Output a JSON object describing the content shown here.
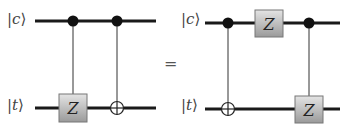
{
  "diagram": {
    "type": "quantum-circuit-identity",
    "left_circuit": {
      "qubits": [
        {
          "name": "control",
          "label_symbol": "c",
          "label": "|c⟩"
        },
        {
          "name": "target",
          "label_symbol": "t",
          "label": "|t⟩"
        }
      ],
      "gates": [
        {
          "type": "controlled-Z",
          "control": "c",
          "target": "t",
          "label": "Z"
        },
        {
          "type": "CNOT",
          "control": "c",
          "target": "t"
        }
      ]
    },
    "equals": "=",
    "right_circuit": {
      "qubits": [
        {
          "name": "control",
          "label_symbol": "c",
          "label": "|c⟩"
        },
        {
          "name": "target",
          "label_symbol": "t",
          "label": "|t⟩"
        }
      ],
      "gates": [
        {
          "type": "CNOT",
          "control": "c",
          "target": "t"
        },
        {
          "type": "Z",
          "qubit": "c",
          "label": "Z"
        },
        {
          "type": "controlled-Z",
          "control": "c",
          "target": "t",
          "label": "Z"
        }
      ]
    },
    "colors": {
      "wire": "#1a1a1a",
      "control_dot": "#111111",
      "gate_fill_top": "#e2e2e2",
      "gate_fill_bottom": "#9c9c9c",
      "gate_stroke": "#777777",
      "label": "#444444"
    }
  }
}
